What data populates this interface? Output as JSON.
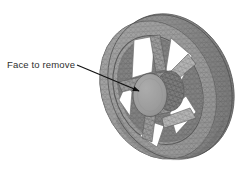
{
  "figure": {
    "kind": "3d-cad-mesh-render",
    "background_color": "#ffffff"
  },
  "annotation": {
    "label": "Face to remove",
    "label_x": 7,
    "label_y": 59,
    "text_color": "#2e2e2e",
    "leader": {
      "name": "leader-arrow",
      "start_x": 77,
      "start_y": 65,
      "end_x": 141,
      "end_y": 92,
      "color": "#111111",
      "line_width": 1.2,
      "arrowhead": "filled-triangle"
    }
  },
  "model": {
    "center_x": 166,
    "center_y": 88,
    "outer_rim": {
      "name": "wheel-outer-rim",
      "fill": "#9a9a9a",
      "stroke": "#5d5d5d",
      "rx": 60,
      "ry": 74,
      "rotation_deg": -22
    },
    "rim_face": {
      "name": "wheel-rim-front-face",
      "fill": "#a8a8a8"
    },
    "inner_bore": {
      "name": "wheel-inner-bore",
      "fill": "#ffffff"
    },
    "hub": {
      "name": "hub-face-to-remove",
      "cx": 150,
      "cy": 95,
      "rx": 17,
      "ry": 21,
      "fill": "#9d9d9d",
      "stroke": "#636363"
    },
    "spokes": {
      "name": "wheel-spokes",
      "count": 5,
      "fill": "#9e9e9e",
      "stroke": "#6a6a6a"
    },
    "mesh": {
      "name": "triangle-mesh-overlay",
      "visible": true,
      "line_color": "#4f4f4f",
      "density": "fine"
    },
    "shading": {
      "highlight": "#c4c4c4",
      "midtone": "#9a9a9a",
      "shadow": "#6f6f6f",
      "deep_shadow": "#555555"
    }
  }
}
